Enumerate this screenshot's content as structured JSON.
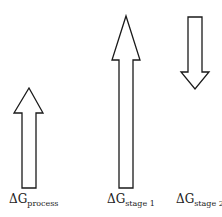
{
  "diagram": {
    "arrows": [
      {
        "id": "process",
        "direction": "up",
        "label_main": "ΔG",
        "label_sub": "process",
        "points": "29,88 43,113 36,113 36,188 22,188 22,113 14,113"
      },
      {
        "id": "stage1",
        "direction": "up",
        "label_main": "ΔG",
        "label_sub": "stage 1",
        "points": "126,16 140,60 133,60 133,188 119,188 119,60 112,60"
      },
      {
        "id": "stage2",
        "direction": "down",
        "label_main": "ΔG",
        "label_sub": "stage 2",
        "points": "188,17 202,17 202,72 209,72 195,89 181,72 188,72"
      }
    ],
    "stroke_color": "#1a1a1a",
    "fill_color": "#ffffff"
  }
}
